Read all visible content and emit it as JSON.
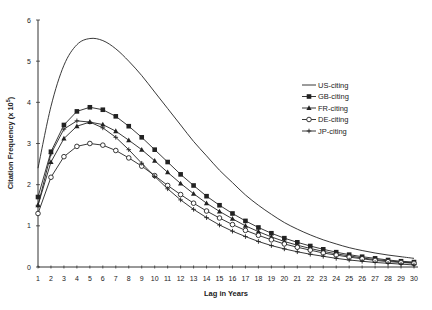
{
  "chart_data": {
    "type": "line",
    "title": "",
    "xlabel": "Lag in Years",
    "ylabel": "Citation Frequency (x 10^5)",
    "ylabel_base": "Citation Frequency (x 10",
    "ylabel_exp": "5",
    "ylabel_close": ")",
    "xlim": [
      1,
      30
    ],
    "ylim": [
      0,
      6
    ],
    "yticks": [
      "0",
      "1",
      "2",
      "3",
      "4",
      "5",
      "6"
    ],
    "x": [
      1,
      2,
      3,
      4,
      5,
      6,
      7,
      8,
      9,
      10,
      11,
      12,
      13,
      14,
      15,
      16,
      17,
      18,
      19,
      20,
      21,
      22,
      23,
      24,
      25,
      26,
      27,
      28,
      29,
      30
    ],
    "grid": false,
    "legend_position": "upper right",
    "series": [
      {
        "name": "US-citing",
        "marker": "none",
        "values": [
          2.4,
          3.9,
          4.9,
          5.4,
          5.55,
          5.5,
          5.3,
          5.0,
          4.65,
          4.25,
          3.85,
          3.45,
          3.05,
          2.7,
          2.35,
          2.05,
          1.75,
          1.5,
          1.28,
          1.08,
          0.92,
          0.78,
          0.66,
          0.56,
          0.47,
          0.4,
          0.34,
          0.29,
          0.25,
          0.21
        ]
      },
      {
        "name": "GB-citing",
        "marker": "filled-square",
        "values": [
          1.7,
          2.8,
          3.45,
          3.78,
          3.88,
          3.82,
          3.66,
          3.42,
          3.15,
          2.85,
          2.55,
          2.25,
          1.98,
          1.72,
          1.5,
          1.3,
          1.12,
          0.96,
          0.82,
          0.7,
          0.6,
          0.51,
          0.43,
          0.36,
          0.3,
          0.25,
          0.21,
          0.17,
          0.14,
          0.12
        ]
      },
      {
        "name": "FR-citing",
        "marker": "filled-triangle",
        "values": [
          1.5,
          2.55,
          3.12,
          3.42,
          3.52,
          3.46,
          3.3,
          3.08,
          2.85,
          2.58,
          2.3,
          2.03,
          1.78,
          1.55,
          1.35,
          1.17,
          1.0,
          0.86,
          0.73,
          0.62,
          0.53,
          0.45,
          0.38,
          0.32,
          0.27,
          0.22,
          0.18,
          0.15,
          0.12,
          0.1
        ]
      },
      {
        "name": "DE-citing",
        "marker": "open-circle",
        "values": [
          1.3,
          2.18,
          2.68,
          2.93,
          3.0,
          2.96,
          2.83,
          2.65,
          2.45,
          2.22,
          1.98,
          1.76,
          1.55,
          1.36,
          1.19,
          1.03,
          0.89,
          0.77,
          0.66,
          0.56,
          0.48,
          0.41,
          0.34,
          0.29,
          0.24,
          0.2,
          0.16,
          0.13,
          0.11,
          0.09
        ]
      },
      {
        "name": "JP-citing",
        "marker": "plus",
        "values": [
          1.5,
          2.75,
          3.35,
          3.55,
          3.52,
          3.38,
          3.15,
          2.85,
          2.52,
          2.2,
          1.9,
          1.63,
          1.4,
          1.2,
          1.02,
          0.87,
          0.74,
          0.62,
          0.52,
          0.44,
          0.37,
          0.31,
          0.26,
          0.21,
          0.17,
          0.14,
          0.11,
          0.09,
          0.07,
          0.05
        ]
      }
    ]
  },
  "colors": {
    "line": "#222222",
    "axis": "#333333",
    "background": "#ffffff"
  }
}
